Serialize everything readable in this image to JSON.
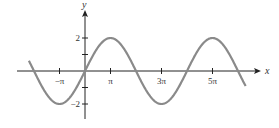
{
  "chart_data": {
    "type": "line",
    "title": "",
    "function": "y = 2 sin(x/2)",
    "xlabel": "x",
    "ylabel": "y",
    "x_ticks": [
      {
        "value_pi": -1,
        "label": "−π"
      },
      {
        "value_pi": 1,
        "label": "π"
      },
      {
        "value_pi": 3,
        "label": "3π"
      },
      {
        "value_pi": 5,
        "label": "5π"
      }
    ],
    "y_ticks": [
      {
        "value": 2,
        "label": "2"
      },
      {
        "value": 1,
        "label": ""
      },
      {
        "value": -1,
        "label": ""
      },
      {
        "value": -2,
        "label": "−2"
      }
    ],
    "xlim_pi": [
      -2.2,
      6.3
    ],
    "ylim": [
      -2.8,
      3.8
    ],
    "series": [
      {
        "name": "2 sin(x/2)",
        "x_pi": [
          -2,
          -1,
          0,
          1,
          2,
          3,
          4,
          5,
          6
        ],
        "y": [
          0,
          -2,
          0,
          2,
          0,
          -2,
          0,
          2,
          0
        ]
      }
    ],
    "grid": false,
    "legend": null,
    "colors": {
      "curve": "#8a8a8a",
      "axis": "#222222"
    }
  }
}
